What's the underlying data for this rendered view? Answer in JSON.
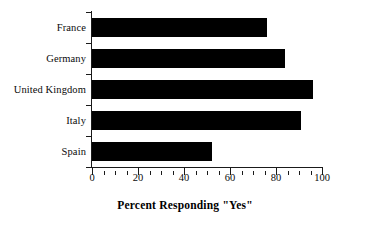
{
  "chart_data": {
    "type": "bar",
    "orientation": "horizontal",
    "title": "",
    "xlabel": "Percent Responding \"Yes\"",
    "ylabel": "",
    "categories": [
      "France",
      "Germany",
      "United Kingdom",
      "Italy",
      "Spain"
    ],
    "values": [
      76,
      84,
      96,
      91,
      52
    ],
    "series": [
      {
        "name": "Percent Responding \"Yes\"",
        "values": [
          76,
          84,
          96,
          91,
          52
        ]
      }
    ],
    "xlim": [
      0,
      100
    ],
    "xticks": [
      0,
      20,
      40,
      60,
      80,
      100
    ],
    "xtick_labels": [
      "0",
      "20",
      "40",
      "60",
      "80",
      "100"
    ],
    "minor_tick_interval": 5,
    "grid": false,
    "legend": false,
    "bar_color": "#000000",
    "axis_color": "#1a1a1a",
    "background_color": "#ffffff"
  },
  "axis": {
    "x_title": "Percent Responding \"Yes\"",
    "tick_labels": [
      "0",
      "20",
      "40",
      "60",
      "80",
      "100"
    ]
  },
  "categories": [
    {
      "label": "France"
    },
    {
      "label": "Germany"
    },
    {
      "label": "United Kingdom"
    },
    {
      "label": "Italy"
    },
    {
      "label": "Spain"
    }
  ]
}
